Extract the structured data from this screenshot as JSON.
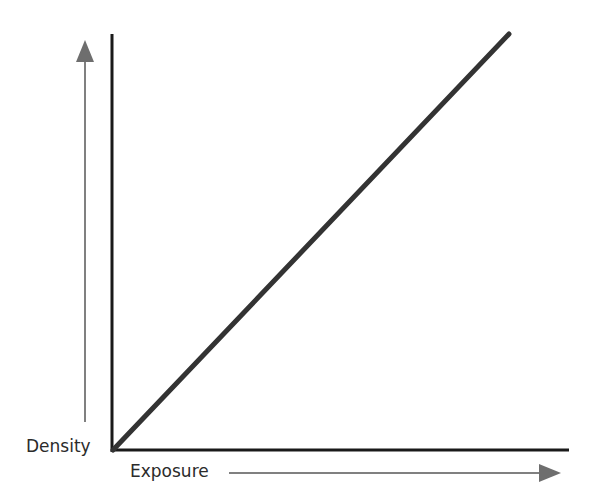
{
  "chart_data": {
    "type": "line",
    "title": "",
    "xlabel": "Exposure",
    "ylabel": "Density",
    "xlim": [
      0,
      1
    ],
    "ylim": [
      0,
      1
    ],
    "grid": false,
    "series": [
      {
        "name": "characteristic curve",
        "x": [
          0,
          0.88
        ],
        "y": [
          0,
          1.0
        ]
      }
    ],
    "annotations": [
      "increasing-exposure-arrow",
      "increasing-density-arrow"
    ]
  },
  "colors": {
    "axis": "#1a1a1a",
    "line": "#333333",
    "arrow": "#808080",
    "text": "#2b2b2b"
  }
}
